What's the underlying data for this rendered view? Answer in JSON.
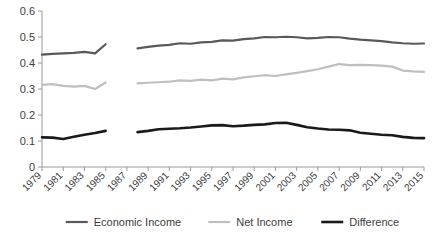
{
  "chart_data": {
    "type": "line",
    "title": "",
    "subtitle": "",
    "xlabel": "",
    "ylabel": "",
    "ylim": [
      0,
      0.6
    ],
    "ytick_labels": [
      "0",
      "0.1",
      "0.2",
      "0.3",
      "0.4",
      "0.5",
      "0.6"
    ],
    "ytick_values": [
      0,
      0.1,
      0.2,
      0.3,
      0.4,
      0.5,
      0.6
    ],
    "grid": false,
    "legend_position": "bottom",
    "x": [
      1979,
      1980,
      1981,
      1982,
      1983,
      1984,
      1985,
      1986,
      1987,
      1988,
      1989,
      1990,
      1991,
      1992,
      1993,
      1994,
      1995,
      1996,
      1997,
      1998,
      1999,
      2000,
      2001,
      2002,
      2003,
      2004,
      2005,
      2006,
      2007,
      2008,
      2009,
      2010,
      2011,
      2012,
      2013,
      2014,
      2015
    ],
    "xtick_labels": [
      "1979",
      "1981",
      "1983",
      "1985",
      "1987",
      "1989",
      "1991",
      "1993",
      "1995",
      "1997",
      "1999",
      "2001",
      "2003",
      "2005",
      "2007",
      "2009",
      "2011",
      "2013",
      "2015"
    ],
    "xtick_values": [
      1979,
      1981,
      1983,
      1985,
      1987,
      1989,
      1991,
      1993,
      1995,
      1997,
      1999,
      2001,
      2003,
      2005,
      2007,
      2009,
      2011,
      2013,
      2015
    ],
    "data_gap_years": [
      1986,
      1987
    ],
    "series": [
      {
        "name": "Economic Income",
        "color": "#595959",
        "width": 2.2,
        "values": [
          0.432,
          0.435,
          0.437,
          0.439,
          0.443,
          0.437,
          0.472,
          null,
          null,
          0.456,
          0.462,
          0.467,
          0.47,
          0.476,
          0.474,
          0.479,
          0.481,
          0.487,
          0.486,
          0.492,
          0.495,
          0.5,
          0.499,
          0.501,
          0.499,
          0.495,
          0.497,
          0.5,
          0.499,
          0.494,
          0.49,
          0.487,
          0.484,
          0.479,
          0.476,
          0.474,
          0.475
        ]
      },
      {
        "name": "Net Income",
        "color": "#bfbfbf",
        "width": 2.2,
        "values": [
          0.316,
          0.319,
          0.312,
          0.309,
          0.312,
          0.3,
          0.325,
          null,
          null,
          0.322,
          0.324,
          0.326,
          0.328,
          0.333,
          0.331,
          0.336,
          0.333,
          0.34,
          0.337,
          0.345,
          0.349,
          0.353,
          0.35,
          0.356,
          0.362,
          0.369,
          0.376,
          0.386,
          0.396,
          0.392,
          0.393,
          0.392,
          0.39,
          0.386,
          0.371,
          0.368,
          0.366
        ]
      },
      {
        "name": "Difference",
        "color": "#1a1a1a",
        "width": 2.6,
        "values": [
          0.114,
          0.113,
          0.108,
          0.116,
          0.124,
          0.131,
          0.139,
          null,
          null,
          0.134,
          0.139,
          0.145,
          0.147,
          0.149,
          0.152,
          0.156,
          0.16,
          0.161,
          0.157,
          0.159,
          0.162,
          0.164,
          0.169,
          0.17,
          0.162,
          0.153,
          0.148,
          0.144,
          0.143,
          0.141,
          0.132,
          0.128,
          0.124,
          0.122,
          0.116,
          0.112,
          0.111
        ]
      }
    ]
  },
  "axes": {
    "y_axis_name": "value-axis",
    "x_axis_name": "year-axis"
  },
  "legend": {
    "items": [
      {
        "label": "Economic Income",
        "color": "#595959"
      },
      {
        "label": "Net Income",
        "color": "#bfbfbf"
      },
      {
        "label": "Difference",
        "color": "#1a1a1a"
      }
    ]
  }
}
